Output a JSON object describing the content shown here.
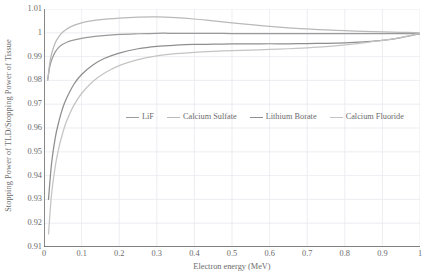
{
  "chart_data": {
    "type": "line",
    "title": "",
    "xlabel": "Electron energy (MeV)",
    "ylabel": "Stopping Power of TLD/Stopping Power of Tissue",
    "xlim": [
      0,
      1
    ],
    "ylim": [
      0.91,
      1.01
    ],
    "xticks": [
      "0",
      "0.1",
      "0.2",
      "0.3",
      "0.4",
      "0.5",
      "0.6",
      "0.7",
      "0.8",
      "0.9",
      "1"
    ],
    "xtick_values": [
      0,
      0.1,
      0.2,
      0.3,
      0.4,
      0.5,
      0.6,
      0.7,
      0.8,
      0.9,
      1
    ],
    "yticks": [
      "0.91",
      "0.92",
      "0.93",
      "0.94",
      "0.95",
      "0.96",
      "0.97",
      "0.98",
      "0.99",
      "1",
      "1.01"
    ],
    "ytick_values": [
      0.91,
      0.92,
      0.93,
      0.94,
      0.95,
      0.96,
      0.97,
      0.98,
      0.99,
      1.0,
      1.01
    ],
    "grid": true,
    "legend_position": "center",
    "series": [
      {
        "name": "LiF",
        "color": "#9a9a9a",
        "x": [
          0.01,
          0.015,
          0.02,
          0.03,
          0.04,
          0.05,
          0.07,
          0.1,
          0.15,
          0.2,
          0.25,
          0.3,
          0.35,
          0.4,
          0.45,
          0.5,
          0.55,
          0.6,
          0.65,
          0.7,
          0.75,
          0.8,
          0.85,
          0.9,
          0.95,
          1.0
        ],
        "values": [
          0.9805,
          0.9855,
          0.9885,
          0.992,
          0.994,
          0.9952,
          0.9966,
          0.9977,
          0.9987,
          0.9993,
          0.9996,
          0.9998,
          0.9998,
          0.9998,
          0.9998,
          0.9997,
          0.9997,
          0.9997,
          0.9997,
          0.9997,
          0.9997,
          0.9997,
          0.9997,
          0.9997,
          0.9997,
          0.9997
        ]
      },
      {
        "name": "Calcium Sulfate",
        "color": "#b9b9b9",
        "x": [
          0.01,
          0.015,
          0.02,
          0.03,
          0.04,
          0.05,
          0.07,
          0.1,
          0.15,
          0.2,
          0.25,
          0.3,
          0.35,
          0.4,
          0.45,
          0.5,
          0.55,
          0.6,
          0.65,
          0.7,
          0.75,
          0.8,
          0.85,
          0.9,
          0.95,
          1.0
        ],
        "values": [
          0.98,
          0.987,
          0.991,
          0.9958,
          0.9985,
          1.0003,
          1.0025,
          1.0042,
          1.0055,
          1.0062,
          1.0066,
          1.0067,
          1.0064,
          1.0058,
          1.005,
          1.0042,
          1.0034,
          1.0027,
          1.0021,
          1.0016,
          1.0012,
          1.0009,
          1.0006,
          1.0004,
          1.0002,
          1.0
        ]
      },
      {
        "name": "Lithium Borate",
        "color": "#8e8e8e",
        "x": [
          0.012,
          0.02,
          0.03,
          0.04,
          0.05,
          0.06,
          0.08,
          0.1,
          0.13,
          0.16,
          0.2,
          0.25,
          0.3,
          0.35,
          0.4,
          0.45,
          0.5,
          0.55,
          0.6,
          0.65,
          0.7,
          0.75,
          0.8,
          0.85,
          0.9,
          0.95,
          1.0
        ],
        "values": [
          0.93,
          0.945,
          0.956,
          0.963,
          0.9685,
          0.9725,
          0.9785,
          0.9825,
          0.9865,
          0.9892,
          0.9915,
          0.9933,
          0.9943,
          0.9948,
          0.9951,
          0.9952,
          0.9953,
          0.9953,
          0.9954,
          0.9954,
          0.9955,
          0.9956,
          0.9958,
          0.9962,
          0.9968,
          0.998,
          0.9996
        ]
      },
      {
        "name": "Calcium Fluoride",
        "color": "#c4c4c4",
        "x": [
          0.012,
          0.02,
          0.03,
          0.04,
          0.05,
          0.06,
          0.08,
          0.1,
          0.13,
          0.16,
          0.2,
          0.25,
          0.3,
          0.35,
          0.4,
          0.45,
          0.5,
          0.55,
          0.6,
          0.65,
          0.7,
          0.75,
          0.8,
          0.85,
          0.9,
          0.95,
          1.0
        ],
        "values": [
          0.9155,
          0.932,
          0.944,
          0.952,
          0.958,
          0.9628,
          0.9697,
          0.9745,
          0.9795,
          0.983,
          0.9862,
          0.9887,
          0.9903,
          0.9912,
          0.9918,
          0.9922,
          0.9925,
          0.9927,
          0.993,
          0.9933,
          0.9937,
          0.9942,
          0.9949,
          0.9958,
          0.9968,
          0.9981,
          0.9997
        ]
      }
    ]
  },
  "legend": {
    "items": [
      {
        "label": "LiF",
        "color": "#9a9a9a"
      },
      {
        "label": "Calcium Sulfate",
        "color": "#b9b9b9"
      },
      {
        "label": "Lithium Borate",
        "color": "#8e8e8e"
      },
      {
        "label": "Calcium Fluoride",
        "color": "#c4c4c4"
      }
    ]
  },
  "style": {
    "grid_color": "#e9e9ef",
    "axis_color": "#595959",
    "text_color": "#6b6b6b",
    "background": "#ffffff"
  }
}
